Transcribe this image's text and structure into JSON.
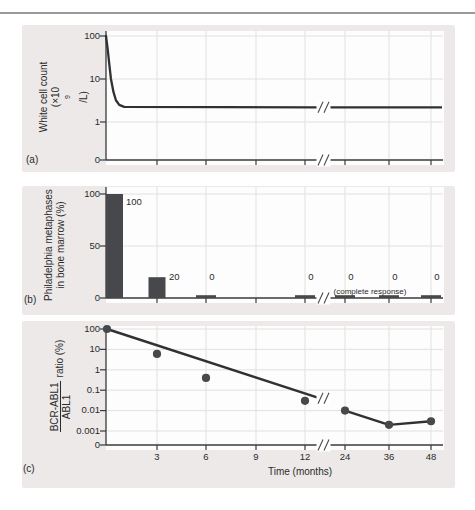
{
  "figure": {
    "x_axis": {
      "title": "Time (months)",
      "tick_labels": [
        "3",
        "6",
        "9",
        "12",
        "24",
        "36",
        "48"
      ],
      "axis_break_between": [
        12,
        24
      ]
    },
    "panel_a": {
      "letter": "(a)",
      "ylabel_line1": "White cell count",
      "ylabel_line2_prefix": "(×10",
      "ylabel_line2_sup": "9",
      "ylabel_line2_suffix": "/L)",
      "yticks": [
        "100",
        "10",
        "1",
        "0"
      ]
    },
    "panel_b": {
      "letter": "(b)",
      "ylabel_line1": "Philadelphia metaphases",
      "ylabel_line2": "in bone marrow (%)",
      "yticks": [
        "100",
        "50",
        "0"
      ],
      "bar_value_labels": [
        "100",
        "20",
        "0",
        "0",
        "0",
        "0",
        "0"
      ],
      "note": "(complete response)"
    },
    "panel_c": {
      "letter": "(c)",
      "ylabel_frac_numerator": "BCR-ABL1",
      "ylabel_frac_denominator": "ABL1",
      "ylabel_suffix": "ratio (%)",
      "yticks": [
        "100",
        "10",
        "1",
        "0.1",
        "0.01",
        "0.001",
        "0"
      ]
    }
  },
  "chart_data": [
    {
      "panel": "a",
      "type": "line",
      "ylabel": "White cell count (x10^9/L)",
      "yscale": "log",
      "ytick_values": [
        100,
        10,
        1,
        0
      ],
      "x_unit": "months",
      "x_tick_months": [
        3,
        6,
        9,
        12,
        24,
        36,
        48
      ],
      "axis_break_between": [
        12,
        24
      ],
      "series": [
        {
          "name": "white cell count",
          "points": [
            [
              0,
              100
            ],
            [
              0.1,
              50
            ],
            [
              0.2,
              22
            ],
            [
              0.3,
              10
            ],
            [
              0.45,
              5
            ],
            [
              0.6,
              3.2
            ],
            [
              0.8,
              2.5
            ],
            [
              1.1,
              2.25
            ],
            [
              12.75,
              2.2
            ],
            [
              48,
              2.2
            ]
          ],
          "summary": "falls rapidly from 100 to ~2.2 within the first month, then constant through 48 months"
        }
      ]
    },
    {
      "panel": "b",
      "type": "bar",
      "ylabel": "Philadelphia metaphases in bone marrow (%)",
      "ytick_values": [
        100,
        50,
        0
      ],
      "categories_months": [
        0,
        3,
        6,
        12,
        24,
        36,
        48
      ],
      "values": [
        100,
        20,
        0,
        0,
        0,
        0,
        0
      ],
      "bar_labels": [
        "100",
        "20",
        "0",
        "0",
        "0",
        "0",
        "0"
      ],
      "annotation": "(complete response)",
      "bar_color": "#46484b"
    },
    {
      "panel": "c",
      "type": "scatter+line",
      "ylabel": "BCR-ABL1/ABL1 ratio (%)",
      "yscale": "log",
      "ytick_values": [
        100,
        10,
        1,
        0.1,
        0.01,
        0.001,
        0
      ],
      "points": [
        [
          0,
          100
        ],
        [
          3,
          6
        ],
        [
          6,
          0.4
        ],
        [
          12,
          0.03
        ],
        [
          24,
          0.01
        ],
        [
          36,
          0.002
        ],
        [
          48,
          0.003
        ]
      ],
      "trend_line": {
        "from_month": 0,
        "from_value": 100,
        "value_at_break": 0.045
      },
      "connected_segment_months": [
        24,
        36,
        48
      ]
    }
  ],
  "style": {
    "panel_bg": "#ece9e8",
    "plot_bg": "#fdfdfd",
    "grid_color": "#e3e1e0",
    "axis_color": "#3a3a3a",
    "data_color": "#46484b",
    "line_color": "#2f3133"
  }
}
